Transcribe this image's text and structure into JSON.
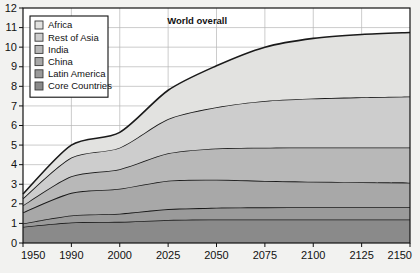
{
  "chart_data": {
    "type": "area",
    "title": "",
    "subtitle": "",
    "xlabel": "",
    "ylabel": "",
    "stacked": true,
    "grid": true,
    "legend_position": "top-left",
    "xlim": [
      1950,
      2150
    ],
    "ylim": [
      0,
      12
    ],
    "x_tick_labels": [
      "1950",
      "1990",
      "2000",
      "2025",
      "2050",
      "2075",
      "2100",
      "2125",
      "2150"
    ],
    "x": [
      1950,
      1990,
      2000,
      2025,
      2050,
      2075,
      2100,
      2125,
      2150
    ],
    "y_tick_labels": [
      "0",
      "1",
      "2",
      "3",
      "4",
      "5",
      "6",
      "7",
      "8",
      "9",
      "10",
      "11",
      "12"
    ],
    "y_ticks": [
      0,
      1,
      2,
      3,
      4,
      5,
      6,
      7,
      8,
      9,
      10,
      11,
      12
    ],
    "annotations": [
      {
        "text": "World overall",
        "x": 2040,
        "y": 11.2
      }
    ],
    "series": [
      {
        "name": "Core Countries",
        "color": "#8a8a8a",
        "values": [
          0.83,
          1.05,
          1.08,
          1.18,
          1.2,
          1.2,
          1.2,
          1.2,
          1.2
        ]
      },
      {
        "name": "Latin America",
        "color": "#9a9a9a",
        "values": [
          0.17,
          0.36,
          0.42,
          0.55,
          0.6,
          0.62,
          0.63,
          0.63,
          0.63
        ]
      },
      {
        "name": "China",
        "color": "#a8a8a8",
        "values": [
          0.56,
          1.15,
          1.27,
          1.45,
          1.43,
          1.35,
          1.3,
          1.27,
          1.25
        ]
      },
      {
        "name": "India",
        "color": "#b8b8b8",
        "values": [
          0.36,
          0.85,
          1.0,
          1.4,
          1.6,
          1.7,
          1.75,
          1.78,
          1.8
        ]
      },
      {
        "name": "Rest of Asia",
        "color": "#cdcdcd",
        "values": [
          0.36,
          0.95,
          1.1,
          1.75,
          2.1,
          2.38,
          2.5,
          2.56,
          2.6
        ]
      },
      {
        "name": "Africa",
        "color": "#e2e2e0",
        "values": [
          0.22,
          0.64,
          0.78,
          1.47,
          2.12,
          2.75,
          3.07,
          3.21,
          3.27
        ]
      }
    ],
    "legend_entries": [
      {
        "label": "Africa",
        "color": "#e2e2e0"
      },
      {
        "label": "Rest of Asia",
        "color": "#cdcdcd"
      },
      {
        "label": "India",
        "color": "#b8b8b8"
      },
      {
        "label": "China",
        "color": "#a8a8a8"
      },
      {
        "label": "Latin America",
        "color": "#9a9a9a"
      },
      {
        "label": "Core Countries",
        "color": "#8a8a8a"
      }
    ],
    "colors": {
      "axis": "#111111",
      "grid": "#b6b6b6",
      "band_outline": "#1a1a1a",
      "page_background": "#f2f2f0",
      "plot_background": "#ffffff"
    }
  }
}
